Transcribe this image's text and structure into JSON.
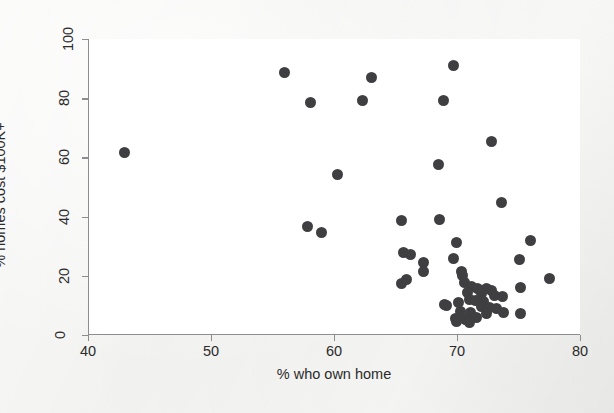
{
  "chart_data": {
    "type": "scatter",
    "title": "My Title",
    "xlabel": "% who own home",
    "ylabel": "% homes cost $100K+",
    "xlim": [
      40,
      80
    ],
    "ylim": [
      0,
      100
    ],
    "xticks": [
      40,
      50,
      60,
      70,
      80
    ],
    "yticks": [
      0,
      20,
      40,
      60,
      80,
      100
    ],
    "xtick_labels": [
      "40",
      "50",
      "60",
      "70",
      "80"
    ],
    "ytick_labels": [
      "0",
      "20",
      "40",
      "60",
      "80",
      "100"
    ],
    "grid": false,
    "legend": null,
    "marker_color": "#3f3f41",
    "marker_shape": "circle",
    "background_color": "#ffffff",
    "axis_color": "#8d8d8d",
    "points": [
      {
        "x": 42.9,
        "y": 61.8
      },
      {
        "x": 55.9,
        "y": 88.8
      },
      {
        "x": 58.0,
        "y": 78.5
      },
      {
        "x": 62.2,
        "y": 79.3
      },
      {
        "x": 63.0,
        "y": 86.9
      },
      {
        "x": 69.6,
        "y": 91.2
      },
      {
        "x": 68.8,
        "y": 79.1
      },
      {
        "x": 72.7,
        "y": 65.4
      },
      {
        "x": 68.4,
        "y": 57.7
      },
      {
        "x": 60.2,
        "y": 54.3
      },
      {
        "x": 73.5,
        "y": 44.8
      },
      {
        "x": 68.5,
        "y": 39.1
      },
      {
        "x": 65.4,
        "y": 38.6
      },
      {
        "x": 57.8,
        "y": 36.6
      },
      {
        "x": 58.9,
        "y": 34.6
      },
      {
        "x": 75.9,
        "y": 32.0
      },
      {
        "x": 69.9,
        "y": 31.4
      },
      {
        "x": 65.6,
        "y": 27.8
      },
      {
        "x": 66.1,
        "y": 27.2
      },
      {
        "x": 69.6,
        "y": 25.8
      },
      {
        "x": 75.0,
        "y": 25.6
      },
      {
        "x": 67.2,
        "y": 24.4
      },
      {
        "x": 67.2,
        "y": 21.6
      },
      {
        "x": 70.3,
        "y": 21.3
      },
      {
        "x": 70.4,
        "y": 20.2
      },
      {
        "x": 77.4,
        "y": 19.0
      },
      {
        "x": 65.8,
        "y": 18.9
      },
      {
        "x": 65.4,
        "y": 17.3
      },
      {
        "x": 70.5,
        "y": 17.6
      },
      {
        "x": 71.1,
        "y": 16.5
      },
      {
        "x": 71.6,
        "y": 15.6
      },
      {
        "x": 72.3,
        "y": 15.8
      },
      {
        "x": 72.7,
        "y": 15.0
      },
      {
        "x": 75.1,
        "y": 16.2
      },
      {
        "x": 70.8,
        "y": 14.2
      },
      {
        "x": 71.9,
        "y": 14.0
      },
      {
        "x": 73.0,
        "y": 13.5
      },
      {
        "x": 73.6,
        "y": 13.0
      },
      {
        "x": 70.9,
        "y": 12.0
      },
      {
        "x": 71.4,
        "y": 11.5
      },
      {
        "x": 72.1,
        "y": 11.4
      },
      {
        "x": 68.9,
        "y": 10.4
      },
      {
        "x": 69.1,
        "y": 9.8
      },
      {
        "x": 70.0,
        "y": 10.9
      },
      {
        "x": 71.9,
        "y": 9.7
      },
      {
        "x": 72.6,
        "y": 9.4
      },
      {
        "x": 73.1,
        "y": 9.0
      },
      {
        "x": 70.2,
        "y": 8.0
      },
      {
        "x": 71.0,
        "y": 7.6
      },
      {
        "x": 72.3,
        "y": 7.4
      },
      {
        "x": 73.7,
        "y": 7.5
      },
      {
        "x": 75.1,
        "y": 7.3
      },
      {
        "x": 69.8,
        "y": 5.6
      },
      {
        "x": 70.6,
        "y": 5.2
      },
      {
        "x": 71.5,
        "y": 5.9
      },
      {
        "x": 69.9,
        "y": 4.6
      },
      {
        "x": 70.9,
        "y": 4.3
      }
    ]
  }
}
